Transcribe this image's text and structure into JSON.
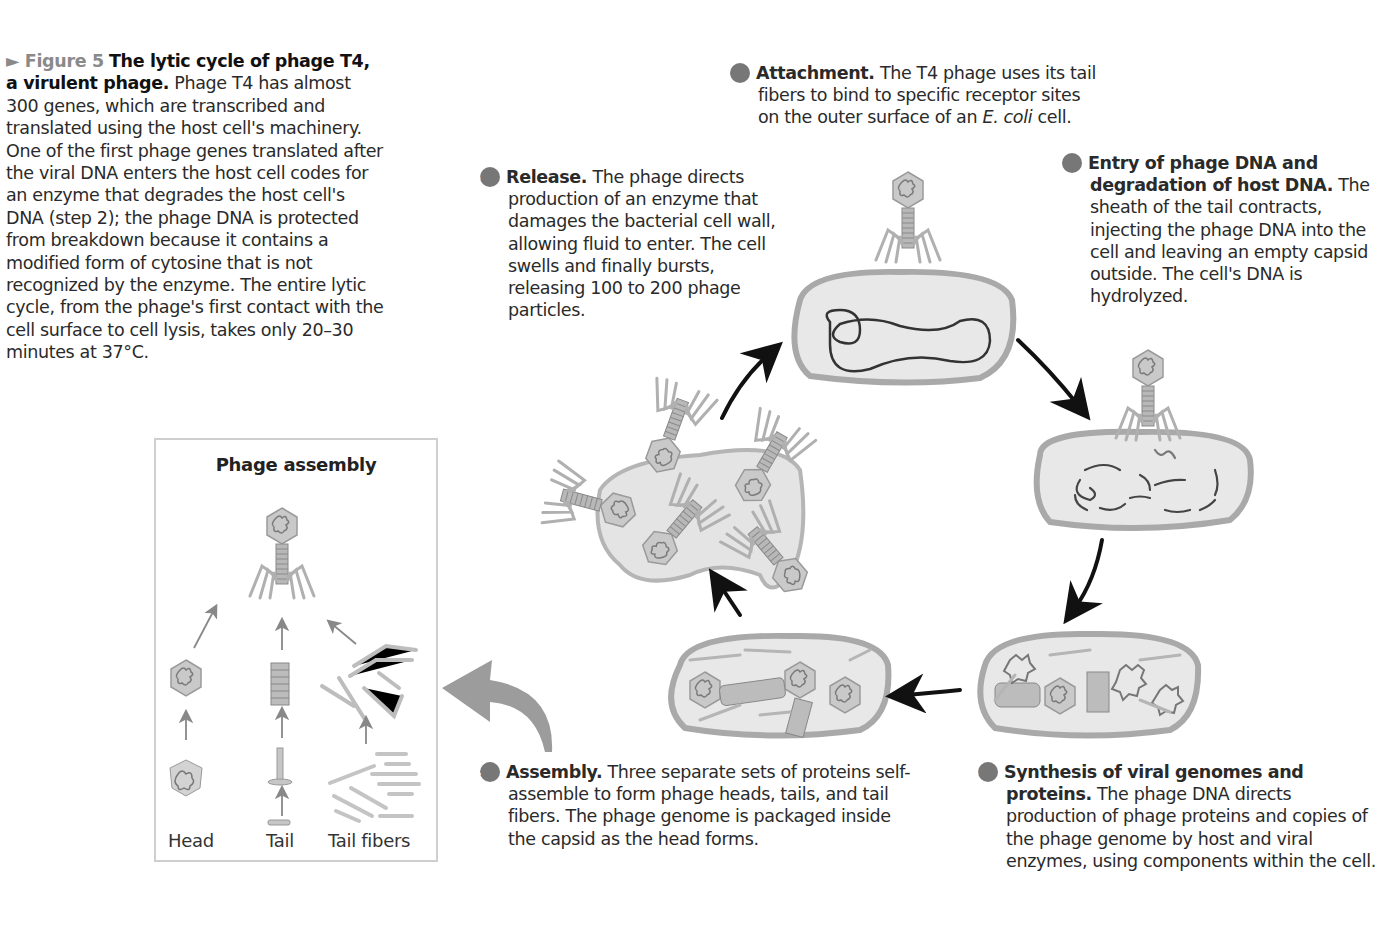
{
  "caption": {
    "figure_label": "Figure 5",
    "title": "The lytic cycle of phage T4, a virulent phage.",
    "body": "Phage T4 has almost 300 genes, which are transcribed and translated using the host cell's machinery. One of the first phage genes translated after the viral DNA enters the host cell codes for an enzyme that degrades the host cell's DNA (step 2); the phage DNA is protected from breakdown because it contains a modified form of cytosine that is not recognized by the enzyme. The entire lytic cycle, from the phage's first contact with the cell surface to cell lysis, takes only 20–30 minutes at 37°C."
  },
  "steps": [
    {
      "number": "1",
      "title": "Attachment.",
      "body": "The T4 phage uses its tail fibers to bind to specific receptor sites on the outer surface of an",
      "italic": "E. coli",
      "tail": "cell."
    },
    {
      "number": "2",
      "title": "Entry of phage DNA and degradation of host DNA.",
      "body": "The sheath of the tail contracts, injecting the phage DNA into the cell and leaving an empty capsid outside. The cell's DNA is hydrolyzed."
    },
    {
      "number": "3",
      "title": "Synthesis of viral genomes and proteins.",
      "body": "The phage DNA directs production of phage proteins and copies of the phage genome by host and viral enzymes, using components within the cell."
    },
    {
      "number": "4",
      "title": "Assembly.",
      "body": "Three separate sets of proteins self-assemble to form phage heads, tails, and tail fibers. The phage genome is packaged inside the capsid as the head forms."
    },
    {
      "number": "5",
      "title": "Release.",
      "body": "The phage directs production of an enzyme that damages the bacterial cell wall, allowing fluid to enter. The cell swells and finally bursts, releasing 100 to 200 phage particles."
    }
  ],
  "assembly": {
    "title": "Phage assembly",
    "labels": [
      "Head",
      "Tail",
      "Tail fibers"
    ]
  },
  "colors": {
    "cell_fill": "#e6e6e6",
    "cell_wall": "#a9a9a9",
    "dna": "#3a3a3a",
    "arrow": "#111111",
    "step_badge": "#777777",
    "figure_label": "#8a8a8a"
  }
}
